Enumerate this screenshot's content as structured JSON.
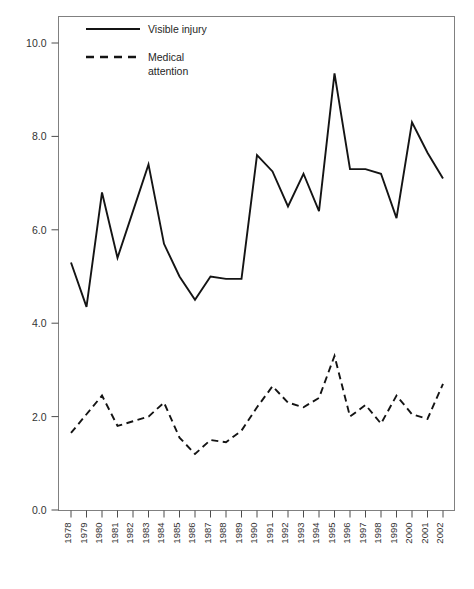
{
  "chart_data": {
    "type": "line",
    "title": "",
    "subtitle": "",
    "xlabel": "",
    "ylabel": "",
    "xlim": [
      1978,
      2002
    ],
    "ylim": [
      0.0,
      10.8
    ],
    "grid": false,
    "legend_position": "top-left",
    "x": [
      1978,
      1979,
      1980,
      1981,
      1982,
      1983,
      1984,
      1985,
      1986,
      1987,
      1988,
      1989,
      1990,
      1991,
      1992,
      1993,
      1994,
      1995,
      1996,
      1997,
      1998,
      1999,
      2000,
      2001,
      2002
    ],
    "categories": [
      "1978",
      "1979",
      "1980",
      "1981",
      "1982",
      "1983",
      "1984",
      "1985",
      "1986",
      "1987",
      "1988",
      "1989",
      "1990",
      "1991",
      "1992",
      "1993",
      "1994",
      "1995",
      "1996",
      "1997",
      "1998",
      "1999",
      "2000",
      "2001",
      "2002"
    ],
    "ytick_labels": [
      "0.0",
      "2.0",
      "4.0",
      "6.0",
      "8.0",
      "10.0"
    ],
    "ytick_values": [
      0.0,
      2.0,
      4.0,
      6.0,
      8.0,
      10.0
    ],
    "series": [
      {
        "name": "Visible injury",
        "style": "solid",
        "color": "#141414",
        "values": [
          5.3,
          4.35,
          6.8,
          5.4,
          6.4,
          7.4,
          5.7,
          5.0,
          4.5,
          5.0,
          4.95,
          4.95,
          7.6,
          7.25,
          6.5,
          7.2,
          6.4,
          9.35,
          7.3,
          7.3,
          7.2,
          6.25,
          8.3,
          7.65,
          7.1
        ]
      },
      {
        "name": "Medical attention",
        "style": "dashed",
        "color": "#141414",
        "values": [
          1.65,
          2.05,
          2.45,
          1.8,
          1.9,
          2.0,
          2.3,
          1.55,
          1.2,
          1.5,
          1.45,
          1.7,
          2.2,
          2.65,
          2.3,
          2.2,
          2.4,
          3.3,
          2.0,
          2.25,
          1.85,
          2.45,
          2.05,
          1.95,
          2.7
        ]
      }
    ]
  },
  "legend": {
    "entries": [
      {
        "label": "Visible injury",
        "label_line2": "",
        "style": "solid"
      },
      {
        "label": "Medical",
        "label_line2": "attention",
        "style": "dashed"
      }
    ]
  }
}
